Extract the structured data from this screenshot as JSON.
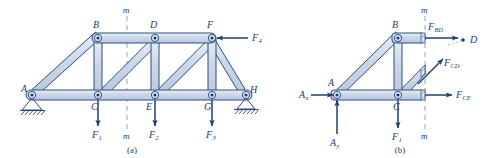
{
  "figure": {
    "colors": {
      "member_fill": "#ccd8e8",
      "member_fill_light": "#e2e9f3",
      "member_stroke": "#2c4c7e",
      "line": "#1d3a66",
      "arrow": "#1f3e73",
      "hatch": "#2c4c7e",
      "dash": "#8d9bb5",
      "background": "#ffffff"
    }
  },
  "panels": [
    {
      "id": "a",
      "caption": "(a)",
      "section_label_top": "m",
      "section_label_bottom": "m",
      "joints": [
        {
          "name": "A",
          "label": "A",
          "x": 32,
          "y": 95,
          "label_x": 21,
          "label_y": 92
        },
        {
          "name": "B",
          "label": "B",
          "x": 98,
          "y": 38,
          "label_x": 93,
          "label_y": 28
        },
        {
          "name": "C",
          "label": "C",
          "x": 98,
          "y": 95,
          "label_x": 91,
          "label_y": 110
        },
        {
          "name": "D",
          "label": "D",
          "x": 155,
          "y": 38,
          "label_x": 150,
          "label_y": 28
        },
        {
          "name": "E",
          "label": "E",
          "x": 155,
          "y": 95,
          "label_x": 146,
          "label_y": 110
        },
        {
          "name": "F",
          "label": "F",
          "x": 212,
          "y": 38,
          "label_x": 207,
          "label_y": 28
        },
        {
          "name": "G",
          "label": "G",
          "x": 212,
          "y": 95,
          "label_x": 204,
          "label_y": 110
        },
        {
          "name": "H",
          "label": "H",
          "x": 246,
          "y": 95,
          "label_x": 250,
          "label_y": 93
        }
      ],
      "loads": [
        {
          "name": "load-f1",
          "base": "F",
          "sub": "1",
          "x": 98,
          "label_x": 92,
          "label_y": 138
        },
        {
          "name": "load-f2",
          "base": "F",
          "sub": "2",
          "x": 155,
          "label_x": 149,
          "label_y": 138
        },
        {
          "name": "load-f3",
          "base": "F",
          "sub": "3",
          "x": 212,
          "label_x": 206,
          "label_y": 138
        },
        {
          "name": "load-f4",
          "base": "F",
          "sub": "4",
          "x": 212,
          "label_x": 252,
          "label_y": 41
        }
      ],
      "supports": [
        {
          "name": "pin-support-a",
          "type": "pin",
          "at": "A"
        },
        {
          "name": "roller-support-h",
          "type": "roller",
          "at": "H"
        }
      ]
    },
    {
      "id": "b",
      "caption": "(b)",
      "section_label_top": "m",
      "section_label_bottom": "m",
      "joints": [
        {
          "name": "A",
          "label": "A",
          "x": 337,
          "y": 95,
          "label_x": 328,
          "label_y": 86
        },
        {
          "name": "B",
          "label": "B",
          "x": 398,
          "y": 38,
          "label_x": 392,
          "label_y": 28
        },
        {
          "name": "C",
          "label": "C",
          "x": 398,
          "y": 95,
          "label_x": 393,
          "label_y": 110
        },
        {
          "name": "D",
          "label": "D",
          "x": 463,
          "y": 40,
          "label_x": 470,
          "label_y": 42
        }
      ],
      "reactions": [
        {
          "name": "reaction-ax",
          "base": "A",
          "sub": "x",
          "label_x": 302,
          "label_y": 97
        },
        {
          "name": "reaction-ay",
          "base": "A",
          "sub": "y",
          "label_x": 330,
          "label_y": 146
        }
      ],
      "loads": [
        {
          "name": "load-f1",
          "base": "F",
          "sub": "1",
          "label_x": 392,
          "label_y": 140
        }
      ],
      "member_forces": [
        {
          "name": "force-fbd",
          "base": "F",
          "sub": "BD",
          "label_x": 430,
          "label_y": 30
        },
        {
          "name": "force-fcd",
          "base": "F",
          "sub": "CD",
          "label_x": 444,
          "label_y": 66
        },
        {
          "name": "force-fce",
          "base": "F",
          "sub": "CE",
          "label_x": 455,
          "label_y": 97
        }
      ]
    }
  ]
}
